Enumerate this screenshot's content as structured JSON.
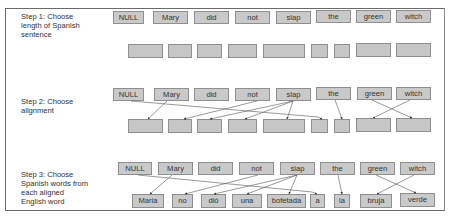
{
  "steps": [
    {
      "label": "Step 1: Choose\nlength of Spanish\nsentence",
      "english": [
        "NULL",
        "Mary",
        "did",
        "not",
        "slap",
        "the",
        "green",
        "witch"
      ],
      "spanish": [
        "",
        "",
        "",
        "",
        "",
        "",
        "",
        "",
        ""
      ]
    },
    {
      "label": "Step 2: Choose\nalignment",
      "english": [
        "NULL",
        "Mary",
        "did",
        "not",
        "slap",
        "the",
        "green",
        "witch"
      ],
      "spanish": [
        "",
        "",
        "",
        "",
        "",
        "",
        "",
        "",
        ""
      ],
      "alignments": [
        {
          "from": "Mary",
          "to_index": 0
        },
        {
          "from": "not",
          "to_index": 1
        },
        {
          "from": "slap",
          "to_index": 2
        },
        {
          "from": "slap",
          "to_index": 3
        },
        {
          "from": "slap",
          "to_index": 4
        },
        {
          "from": "NULL",
          "to_index": 5
        },
        {
          "from": "the",
          "to_index": 6
        },
        {
          "from": "witch",
          "to_index": 7
        },
        {
          "from": "green",
          "to_index": 8
        }
      ]
    },
    {
      "label": "Step 3: Choose\nSpanish words from\neach aligned\nEnglish word",
      "english": [
        "NULL",
        "Mary",
        "did",
        "not",
        "slap",
        "the",
        "green",
        "witch"
      ],
      "spanish": [
        "Maria",
        "no",
        "dió",
        "una",
        "bofetada",
        "a",
        "la",
        "bruja",
        "verde"
      ],
      "alignments": [
        {
          "from": "Mary",
          "to": "Maria"
        },
        {
          "from": "not",
          "to": "no"
        },
        {
          "from": "slap",
          "to": "dió"
        },
        {
          "from": "slap",
          "to": "una"
        },
        {
          "from": "slap",
          "to": "bofetada"
        },
        {
          "from": "NULL",
          "to": "a"
        },
        {
          "from": "the",
          "to": "la"
        },
        {
          "from": "witch",
          "to": "bruja"
        },
        {
          "from": "green",
          "to": "verde"
        }
      ]
    }
  ],
  "colors": {
    "box_fill": "#c9c9c9",
    "box_border": "#8f8f8f",
    "line": "#555555",
    "frame": "#6a6a6a"
  }
}
